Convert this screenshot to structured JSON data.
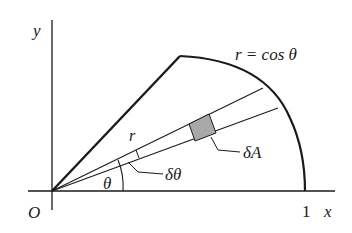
{
  "diagram": {
    "axes": {
      "y_label": "y",
      "x_label": "x",
      "origin_label": "O",
      "x_tick_label": "1"
    },
    "curve_label": "r = cos θ",
    "angle_label": "θ",
    "radius_label": "r",
    "dtheta_label": "δθ",
    "area_label": "δA",
    "colors": {
      "stroke": "#1a1a1a",
      "element_fill": "#a8a8a8"
    }
  }
}
